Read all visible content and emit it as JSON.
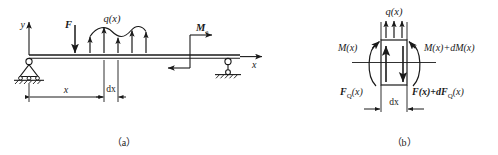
{
  "figure": {
    "title_a": "（a）",
    "title_b": "（b）",
    "stroke_color": "#1a1a1a",
    "background_color": "#ffffff"
  },
  "panel_a": {
    "name": "simply-supported-beam-loading-diagram",
    "axis_y_label": "y",
    "axis_x_label": "x",
    "point_load_label": "F",
    "distributed_load_label": "q(x)",
    "moment_label_base": "M",
    "moment_label_sub": "e",
    "dimension_x_label": "x",
    "dimension_dx_label": "dx",
    "caption": "（a）",
    "supports": {
      "left": "pin-support",
      "right": "roller-support"
    },
    "distributed_load_arrow_count": 5,
    "load_direction_point": "down",
    "load_direction_distributed": "up"
  },
  "panel_b": {
    "name": "differential-element-free-body-diagram",
    "distributed_load_label": "q(x)",
    "moment_left_label": "M(x)",
    "moment_right_label": "M(x)+dM(x)",
    "shear_left_label_base": "F",
    "shear_left_label_sub": "Q",
    "shear_left_label_tail": "(x)",
    "shear_right_label": "F(x)+dF",
    "shear_right_label_sub": "Q",
    "shear_right_label_tail": "(x)",
    "dimension_dx_label": "dx",
    "caption": "（b）",
    "distributed_load_arrow_count": 3,
    "shear_left_direction": "up",
    "shear_right_direction": "down"
  }
}
